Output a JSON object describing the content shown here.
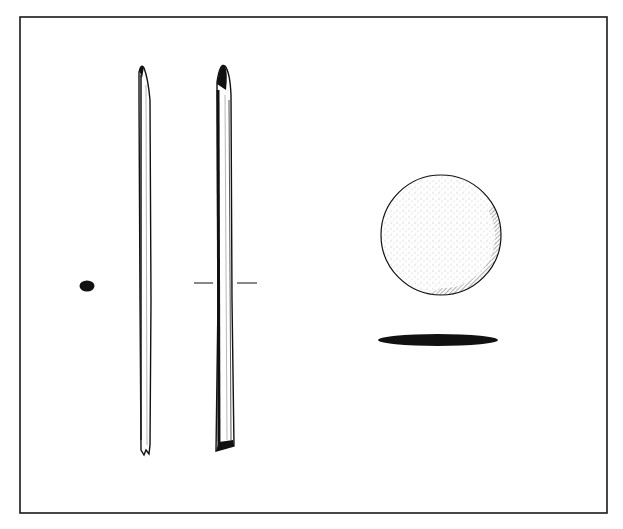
{
  "figure": {
    "title": "",
    "ink_color": "#1a1a1a",
    "paper_color": "#ffffff",
    "artifacts": [
      {
        "name": "pin",
        "views": [
          "cross-section",
          "side-view",
          "front-view"
        ]
      },
      {
        "name": "disc",
        "views": [
          "plan-view",
          "section-view"
        ]
      }
    ]
  }
}
